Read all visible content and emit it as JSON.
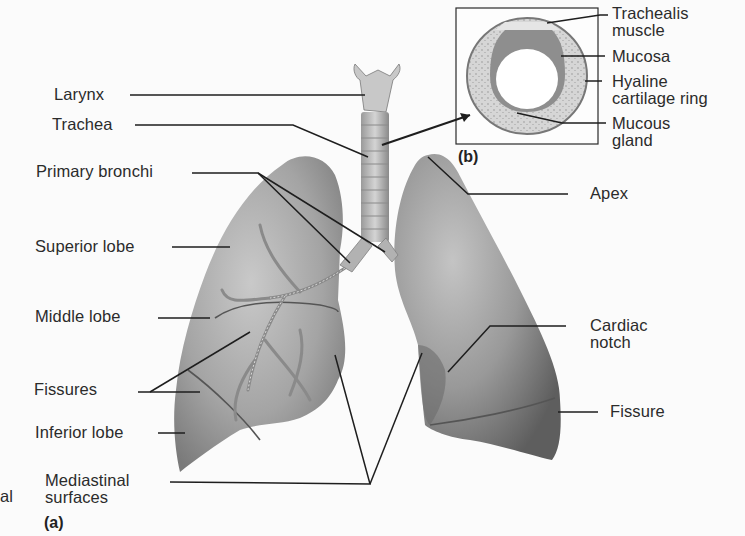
{
  "figure": {
    "panel_a_tag": "(a)",
    "panel_b_tag": "(b)",
    "edge_fragment": "al",
    "labels_left": [
      {
        "id": "larynx",
        "text": "Larynx"
      },
      {
        "id": "trachea",
        "text": "Trachea"
      },
      {
        "id": "primary-bronchi",
        "text": "Primary bronchi"
      },
      {
        "id": "superior-lobe",
        "text": "Superior lobe"
      },
      {
        "id": "middle-lobe",
        "text": "Middle lobe"
      },
      {
        "id": "fissures",
        "text": "Fissures"
      },
      {
        "id": "inferior-lobe",
        "text": "Inferior lobe"
      },
      {
        "id": "mediastinal-surfaces",
        "line1": "Mediastinal",
        "line2": "surfaces"
      }
    ],
    "labels_right": [
      {
        "id": "apex",
        "text": "Apex"
      },
      {
        "id": "cardiac-notch",
        "line1": "Cardiac",
        "line2": "notch"
      },
      {
        "id": "fissure",
        "text": "Fissure"
      }
    ],
    "inset_labels": [
      {
        "id": "trachealis-muscle",
        "line1": "Trachealis",
        "line2": "muscle"
      },
      {
        "id": "mucosa",
        "text": "Mucosa"
      },
      {
        "id": "hyaline-cartilage-ring",
        "line1": "Hyaline",
        "line2": "cartilage ring"
      },
      {
        "id": "mucous-gland",
        "line1": "Mucous",
        "line2": "gland"
      }
    ],
    "colors": {
      "background": "#fbfbfb",
      "lung_light": "#b9b9b9",
      "lung_dark": "#6f6f6f",
      "line": "#1e1e1e",
      "cartilage": "#d8d8d8"
    }
  }
}
